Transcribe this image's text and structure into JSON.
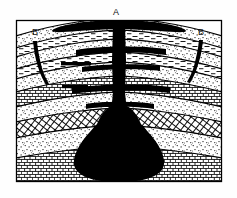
{
  "figure": {
    "kind": "geologic-cross-section",
    "title_visible": false,
    "background_color": "#fefefe",
    "ink_color": "#000000",
    "frame": {
      "x": 16,
      "y": 20,
      "width": 206,
      "height": 162,
      "stroke": "#000000",
      "stroke_width": 1.2
    }
  },
  "labels": [
    {
      "id": "A",
      "text": "A",
      "x": 115,
      "y": 16,
      "refers_to": "central-vent-conduit"
    },
    {
      "id": "B-left",
      "text": "B",
      "x": 35,
      "y": 33,
      "refers_to": "flank-fissure-left"
    },
    {
      "id": "B-right",
      "text": "B",
      "x": 199,
      "y": 33,
      "refers_to": "flank-fissure-right"
    }
  ],
  "features": {
    "central_conduit": {
      "name": "central volcanic conduit",
      "color": "#000000"
    },
    "summit_sill": {
      "name": "summit lava sheet",
      "color": "#000000"
    },
    "magma_chamber": {
      "name": "magma chamber",
      "color": "#000000"
    },
    "sills": {
      "name": "horizontal sills",
      "count": 4,
      "color": "#000000"
    },
    "fissures": {
      "name": "flank fissures",
      "count": 2,
      "color": "#000000"
    }
  },
  "strata": [
    {
      "index": 0,
      "pattern": "stipple",
      "rock": "sandstone"
    },
    {
      "index": 1,
      "pattern": "dash",
      "rock": "shale"
    },
    {
      "index": 2,
      "pattern": "stipple",
      "rock": "sandstone"
    },
    {
      "index": 3,
      "pattern": "dash",
      "rock": "shale"
    },
    {
      "index": 4,
      "pattern": "stipple",
      "rock": "sandstone"
    },
    {
      "index": 5,
      "pattern": "brick",
      "rock": "limestone"
    },
    {
      "index": 6,
      "pattern": "stipple",
      "rock": "sandstone"
    },
    {
      "index": 7,
      "pattern": "crosshatch",
      "rock": "schist"
    },
    {
      "index": 8,
      "pattern": "stipple",
      "rock": "sandstone"
    },
    {
      "index": 9,
      "pattern": "brick",
      "rock": "limestone"
    }
  ]
}
